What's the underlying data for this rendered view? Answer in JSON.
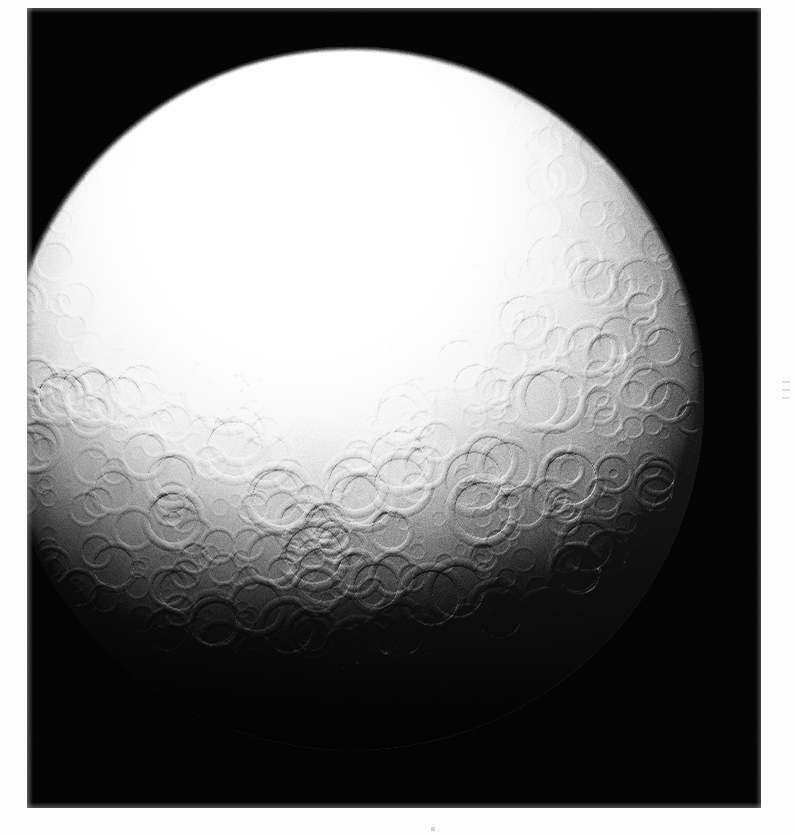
{
  "image": {
    "kind": "spacecraft-photograph",
    "subject": "icy cratered moon",
    "orientation": "portrait",
    "canvas_width_px": 796,
    "canvas_height_px": 834,
    "paper_background_color": "#fdfdfd",
    "frame": {
      "name": "photographic print border",
      "left_px": 27,
      "top_px": 8,
      "width_px": 734,
      "height_px": 800,
      "sky_color": "#050505"
    },
    "palette": {
      "sky_black": "#050505",
      "limb_shadow": "#0b0b0b",
      "terrain_dark": "#3a3a3a",
      "terrain_mid": "#8e8e8e",
      "terrain_light": "#d6d6d6",
      "terrain_highlight": "#f4f4f4",
      "subsolar_white": "#fbfbfb",
      "paper_white": "#fdfdfd",
      "margin_mark_gray": "#b9b9b9"
    }
  },
  "body": {
    "name": "moon disk",
    "center_x_px": 352,
    "center_y_px": 398,
    "radius_px": 352,
    "illumination": "gibbous, sun high and slightly upper-left; terminator sweeps across lower-left to lower-right limb",
    "subsolar_point": {
      "x_px": 300,
      "y_px": 190
    },
    "terrain_note": "densely cratered ancient icy surface; smooth washed-out bright polar cap region at top, heavy shadowed crater fields toward the lower limb"
  },
  "surface_features": {
    "named_regions": [
      {
        "id": "bright-cap",
        "label": "bright washed-out upper terrain",
        "cx": 330,
        "cy": 190,
        "rx": 260,
        "ry": 150
      },
      {
        "id": "crater-plain",
        "label": "dense crater plain",
        "cx": 400,
        "cy": 460,
        "rx": 300,
        "ry": 190
      },
      {
        "id": "terminator-shadow",
        "label": "lower-limb shadow zone",
        "cx": 360,
        "cy": 700,
        "rx": 330,
        "ry": 160
      }
    ],
    "prominent_craters": [
      {
        "id": "central-peak-crater",
        "label": "large crater with dark floor and bright rim",
        "x": 173,
        "y": 518,
        "r": 30,
        "rim_bright": 0.95,
        "floor_dark": 0.85,
        "has_central_pit": true
      },
      {
        "id": "right-rim-crater-a",
        "label": "bright-rimmed crater near right limb",
        "x": 613,
        "y": 473,
        "r": 19,
        "rim_bright": 0.9,
        "floor_dark": 0.6,
        "has_central_pit": true
      },
      {
        "id": "right-rim-crater-b",
        "label": "shadowed crater on right terminator",
        "x": 706,
        "y": 487,
        "r": 22,
        "rim_bright": 0.95,
        "floor_dark": 0.9,
        "has_central_pit": false
      },
      {
        "id": "right-rim-crater-c",
        "label": "large shadowed crater lower right",
        "x": 652,
        "y": 568,
        "r": 27,
        "rim_bright": 0.85,
        "floor_dark": 0.95,
        "has_central_pit": false
      },
      {
        "id": "right-rim-crater-d",
        "label": "paired crater lower right",
        "x": 628,
        "y": 618,
        "r": 24,
        "rim_bright": 0.9,
        "floor_dark": 0.9,
        "has_central_pit": true
      },
      {
        "id": "lower-crater-e",
        "label": "crater near bottom terminator",
        "x": 523,
        "y": 636,
        "r": 21,
        "rim_bright": 0.85,
        "floor_dark": 0.9,
        "has_central_pit": false
      },
      {
        "id": "lower-crater-f",
        "label": "crater on lower limb",
        "x": 402,
        "y": 676,
        "r": 23,
        "rim_bright": 0.8,
        "floor_dark": 0.9,
        "has_central_pit": false
      },
      {
        "id": "left-dark-patch",
        "label": "dark patch on left limb",
        "x": 57,
        "y": 377,
        "r": 12,
        "rim_bright": 0.2,
        "floor_dark": 0.95,
        "has_central_pit": false
      }
    ],
    "grooves": [
      {
        "id": "groove-1",
        "label": "linear groove across bright cap",
        "x1": 300,
        "y1": 120,
        "x2": 400,
        "y2": 260
      },
      {
        "id": "groove-2",
        "label": "linear groove",
        "x1": 360,
        "y1": 140,
        "x2": 455,
        "y2": 265
      },
      {
        "id": "groove-3",
        "label": "linear groove",
        "x1": 250,
        "y1": 175,
        "x2": 330,
        "y2": 300
      },
      {
        "id": "groove-4",
        "label": "linear groove",
        "x1": 420,
        "y1": 175,
        "x2": 520,
        "y2": 285
      }
    ]
  },
  "margin_marks": [
    {
      "id": "right-tick-1",
      "x": 782,
      "y": 381,
      "w": 8,
      "h": 2
    },
    {
      "id": "right-tick-2",
      "x": 782,
      "y": 389,
      "w": 8,
      "h": 2
    },
    {
      "id": "right-tick-3",
      "x": 782,
      "y": 397,
      "w": 7,
      "h": 2
    },
    {
      "id": "bottom-speck",
      "x": 431,
      "y": 827,
      "w": 4,
      "h": 4
    }
  ],
  "generation": {
    "crater_count": 1500,
    "speckle_count": 2600,
    "random_seed": 20250219
  }
}
